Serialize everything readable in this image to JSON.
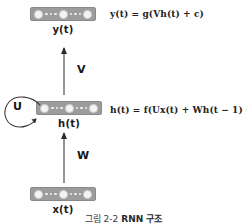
{
  "diagram": {
    "caption_prefix": "그림 2-2",
    "caption_title": "RNN 구조",
    "layers": [
      {
        "id": "output",
        "label": "y(t)",
        "equation": "y(t) = g(Vh(t) + c)"
      },
      {
        "id": "hidden",
        "label": "h(t)",
        "equation": "h(t) = f(Ux(t) + Wh(t − 1) + b)"
      },
      {
        "id": "input",
        "label": "x(t)",
        "equation": ""
      }
    ],
    "weights": [
      {
        "id": "V",
        "label": "V",
        "from": "h(t)",
        "to": "y(t)"
      },
      {
        "id": "W",
        "label": "W",
        "from": "x(t)",
        "to": "h(t)"
      },
      {
        "id": "U",
        "label": "U",
        "from": "h(t)",
        "to": "h(t)"
      }
    ],
    "colors": {
      "block_fill": "#9c9c9c",
      "node_fill": "#f4f4f4",
      "arrow": "#2b2b2b",
      "text": "#1a1a1a",
      "background": "#ffffff"
    }
  }
}
